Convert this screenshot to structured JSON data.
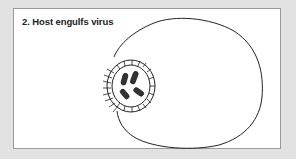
{
  "diagram": {
    "title": "2. Host engulfs virus",
    "elements": [
      {
        "name": "host-cell",
        "description": "Large irregular cell outline"
      },
      {
        "name": "virus-particle",
        "description": "Circular virus with spiky capsid surface being engulfed at cell membrane"
      },
      {
        "name": "genetic-material",
        "description": "Four rod-shaped bodies inside the virus"
      }
    ],
    "colors": {
      "background": "#e2e2e2",
      "panel": "#ffffff",
      "border": "#9a9a9a",
      "stroke": "#222222"
    }
  }
}
